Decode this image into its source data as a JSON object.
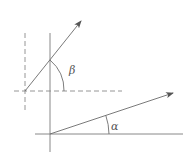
{
  "diagram": {
    "labels": {
      "beta": "β",
      "alpha": "α"
    },
    "colors": {
      "line": "#7a7a7a",
      "dashed": "#8a8a8a",
      "text": "#555555",
      "background": "#ffffff"
    },
    "upper_vector": {
      "origin": [
        25,
        91
      ],
      "tip": [
        81,
        21
      ],
      "angle_label": "β"
    },
    "lower_vector": {
      "origin": [
        50,
        134
      ],
      "tip": [
        173,
        93
      ],
      "angle_label": "α"
    },
    "reference_lines": {
      "vertical_solid": {
        "x": 50,
        "y1": 33,
        "y2": 152
      },
      "vertical_dashed": {
        "x": 25,
        "y1": 33,
        "y2": 112
      },
      "horizontal_dashed": {
        "y": 91,
        "x1": 14,
        "x2": 122
      },
      "horizontal_solid": {
        "y": 134,
        "x1": 35,
        "x2": 183
      }
    }
  }
}
